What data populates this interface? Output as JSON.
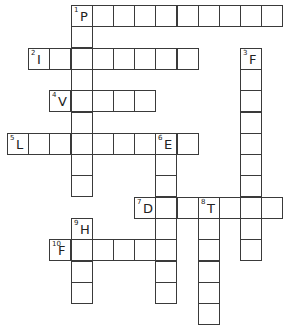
{
  "puzzle": {
    "title": "Crossword",
    "grid": {
      "origin_x": 8,
      "origin_y": 6,
      "cell_w": 21.2,
      "cell_h": 21.3
    },
    "words": [
      {
        "number": 1,
        "direction": "across",
        "row": 0,
        "col": 3,
        "length": 10,
        "first_letter": "P"
      },
      {
        "number": 1,
        "direction": "down",
        "row": 0,
        "col": 3,
        "length": 9,
        "first_letter": "P"
      },
      {
        "number": 2,
        "direction": "across",
        "row": 2,
        "col": 1,
        "length": 8,
        "first_letter": "I"
      },
      {
        "number": 3,
        "direction": "down",
        "row": 2,
        "col": 11,
        "length": 10,
        "first_letter": "F"
      },
      {
        "number": 4,
        "direction": "across",
        "row": 4,
        "col": 2,
        "length": 5,
        "first_letter": "V"
      },
      {
        "number": 5,
        "direction": "across",
        "row": 6,
        "col": 0,
        "length": 9,
        "first_letter": "L"
      },
      {
        "number": 6,
        "direction": "down",
        "row": 6,
        "col": 7,
        "length": 8,
        "first_letter": "E"
      },
      {
        "number": 7,
        "direction": "across",
        "row": 9,
        "col": 6,
        "length": 7,
        "first_letter": "D"
      },
      {
        "number": 8,
        "direction": "down",
        "row": 9,
        "col": 9,
        "length": 6,
        "first_letter": "T"
      },
      {
        "number": 9,
        "direction": "down",
        "row": 10,
        "col": 3,
        "length": 4,
        "first_letter": "H"
      },
      {
        "number": 10,
        "direction": "across",
        "row": 11,
        "col": 2,
        "length": 6,
        "first_letter": "F"
      }
    ]
  }
}
